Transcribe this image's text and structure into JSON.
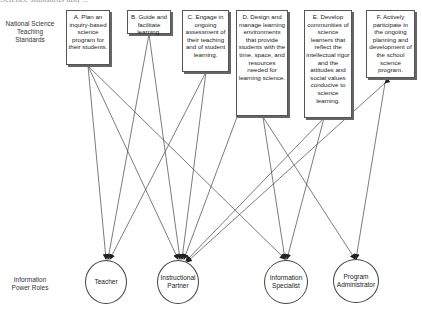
{
  "header": {
    "cut_off_title": "Science standards and ..."
  },
  "row_labels": {
    "standards": "National Science Teaching Standards",
    "roles": "Information Power Roles"
  },
  "standards": [
    {
      "id": "A",
      "label": "A. Plan an inquiry-based science program for their students."
    },
    {
      "id": "B",
      "label": "B. Guide and facilitate learning."
    },
    {
      "id": "C",
      "label": "C. Engage in ongoing assessment of their teaching and of student learning."
    },
    {
      "id": "D",
      "label": "D. Design and manage learning environments that provide students with the time, space, and resources needed for learning science."
    },
    {
      "id": "E",
      "label": "E. Develop communities of science learners that reflect the intellectual rigor and the attitudes and social values conducive to science learning."
    },
    {
      "id": "F",
      "label": "F. Actively participate in the ongoing planning and development of the school science program."
    }
  ],
  "roles": [
    {
      "id": "teacher",
      "label": "Teacher"
    },
    {
      "id": "instructional_partner",
      "label": "Instructional Partner"
    },
    {
      "id": "information_specialist",
      "label": "Information Specialist"
    },
    {
      "id": "program_administrator",
      "label": "Program Administrator"
    }
  ],
  "connections": [
    {
      "from": "A",
      "to": "teacher"
    },
    {
      "from": "A",
      "to": "instructional_partner"
    },
    {
      "from": "A",
      "to": "information_specialist"
    },
    {
      "from": "B",
      "to": "teacher"
    },
    {
      "from": "B",
      "to": "instructional_partner"
    },
    {
      "from": "C",
      "to": "teacher"
    },
    {
      "from": "C",
      "to": "instructional_partner"
    },
    {
      "from": "D",
      "to": "instructional_partner"
    },
    {
      "from": "D",
      "to": "information_specialist"
    },
    {
      "from": "D",
      "to": "program_administrator"
    },
    {
      "from": "E",
      "to": "instructional_partner"
    },
    {
      "from": "E",
      "to": "information_specialist"
    },
    {
      "from": "F",
      "to": "instructional_partner"
    },
    {
      "from": "F",
      "to": "program_administrator"
    }
  ],
  "colors": {
    "line": "#444444",
    "box_border": "#555555",
    "box_shadow": "#666666"
  }
}
